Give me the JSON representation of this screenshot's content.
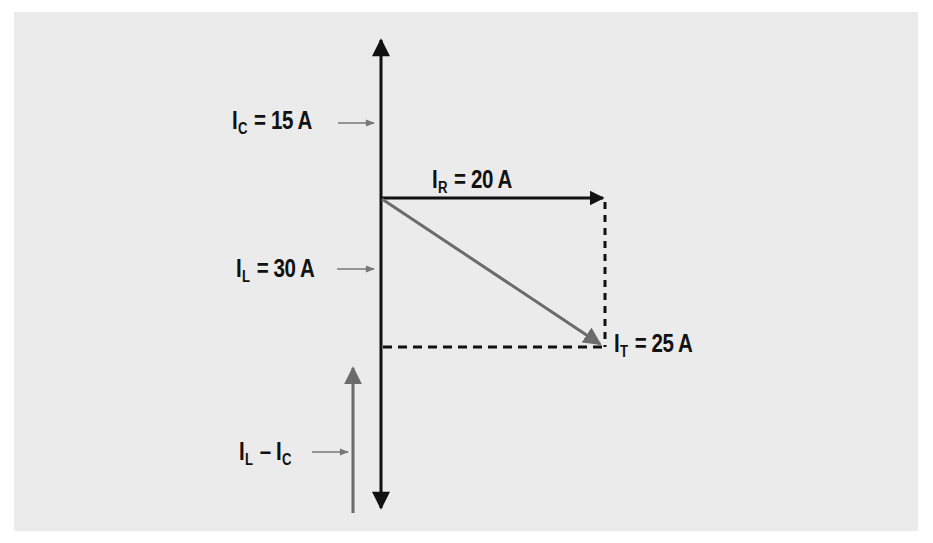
{
  "diagram": {
    "type": "phasor-diagram",
    "title": "",
    "colors": {
      "background": "#ffffff",
      "panel": "#ebebeb",
      "primary_line": "#111111",
      "resultant_line": "#6b6b6b",
      "pointer_arrow": "#777777"
    },
    "labels": {
      "ic": {
        "symbol": "I",
        "subscript": "C",
        "equals": "=",
        "value": "15 A"
      },
      "ir": {
        "symbol": "I",
        "subscript": "R",
        "equals": "=",
        "value": "20 A"
      },
      "il": {
        "symbol": "I",
        "subscript": "L",
        "equals": "=",
        "value": "30 A"
      },
      "it": {
        "symbol": "I",
        "subscript": "T",
        "equals": "=",
        "value": "25 A"
      },
      "il_minus_ic": {
        "symbol1": "I",
        "subscript1": "L",
        "minus": "–",
        "symbol2": "I",
        "subscript2": "C"
      }
    },
    "vectors": [
      {
        "name": "I_C",
        "magnitude_A": 15,
        "direction": "up"
      },
      {
        "name": "I_L",
        "magnitude_A": 30,
        "direction": "down"
      },
      {
        "name": "I_R",
        "magnitude_A": 20,
        "direction": "right"
      },
      {
        "name": "I_T",
        "magnitude_A": 25,
        "direction": "down-right (resultant)"
      },
      {
        "name": "I_L - I_C",
        "magnitude_A": 15,
        "direction": "net reactive"
      }
    ]
  }
}
